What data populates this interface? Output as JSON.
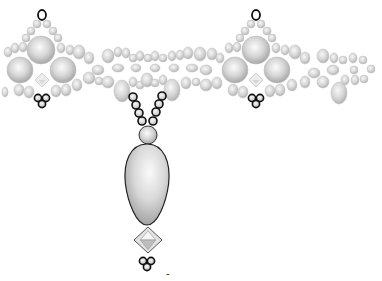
{
  "diagram": {
    "title": "Beaded pendant necklace pattern",
    "type": "beadwork pattern",
    "colors": {
      "background": "#ffffff",
      "bead_light": "#f4f4f4",
      "bead_mid": "#d2d2d2",
      "bead_dark": "#9c9c9c",
      "outline_bold": "#111111",
      "outline_soft": "#8a8a8a"
    },
    "legend": {
      "bold_outline": "highlighted seed beads (thread path)",
      "grey_bead": "seed / round beads",
      "large_round": "large pearl beads",
      "bicone": "bicone crystal",
      "drop": "teardrop pendant"
    },
    "motifs": [
      {
        "name": "left-cluster",
        "cx": 42,
        "cy": 68
      },
      {
        "name": "right-cluster",
        "cx": 256,
        "cy": 68
      }
    ],
    "large_pearls": [
      {
        "cx": 41,
        "cy": 50,
        "r": 14
      },
      {
        "cx": 20,
        "cy": 70,
        "r": 13
      },
      {
        "cx": 63,
        "cy": 70,
        "r": 13
      },
      {
        "cx": 256,
        "cy": 50,
        "r": 14
      },
      {
        "cx": 235,
        "cy": 70,
        "r": 13
      },
      {
        "cx": 277,
        "cy": 70,
        "r": 13
      }
    ],
    "bicones_small": [
      {
        "cx": 42,
        "cy": 80,
        "w": 14,
        "h": 14
      },
      {
        "cx": 256,
        "cy": 80,
        "w": 14,
        "h": 14
      }
    ],
    "top_loops": [
      {
        "cx": 42,
        "cy": 15,
        "rx": 4,
        "ry": 5
      },
      {
        "cx": 256,
        "cy": 15,
        "rx": 4,
        "ry": 5
      }
    ],
    "bottom_trefoils": [
      {
        "cx": 42,
        "cy": 98
      },
      {
        "cx": 256,
        "cy": 98
      }
    ],
    "seed_beads": [
      {
        "cx": 37,
        "cy": 24,
        "rx": 4,
        "ry": 4
      },
      {
        "cx": 47,
        "cy": 24,
        "rx": 4,
        "ry": 4
      },
      {
        "cx": 31,
        "cy": 31,
        "rx": 4,
        "ry": 4
      },
      {
        "cx": 53,
        "cy": 31,
        "rx": 4,
        "ry": 4
      },
      {
        "cx": 26,
        "cy": 38,
        "rx": 4,
        "ry": 4
      },
      {
        "cx": 58,
        "cy": 38,
        "rx": 4,
        "ry": 4
      },
      {
        "cx": 15,
        "cy": 48,
        "rx": 4,
        "ry": 5
      },
      {
        "cx": 23,
        "cy": 47,
        "rx": 4,
        "ry": 5
      },
      {
        "cx": 61,
        "cy": 48,
        "rx": 4,
        "ry": 5
      },
      {
        "cx": 70,
        "cy": 50,
        "rx": 4,
        "ry": 5
      },
      {
        "cx": 79,
        "cy": 52,
        "rx": 6,
        "ry": 7
      },
      {
        "cx": 89,
        "cy": 58,
        "rx": 5,
        "ry": 6
      },
      {
        "cx": 98,
        "cy": 70,
        "rx": 6,
        "ry": 5
      },
      {
        "cx": 19,
        "cy": 90,
        "rx": 5,
        "ry": 6
      },
      {
        "cx": 29,
        "cy": 92,
        "rx": 5,
        "ry": 6
      },
      {
        "cx": 56,
        "cy": 91,
        "rx": 5,
        "ry": 6
      },
      {
        "cx": 66,
        "cy": 90,
        "rx": 5,
        "ry": 6
      },
      {
        "cx": 77,
        "cy": 85,
        "rx": 5,
        "ry": 6
      },
      {
        "cx": 89,
        "cy": 78,
        "rx": 6,
        "ry": 6
      },
      {
        "cx": 99,
        "cy": 81,
        "rx": 4,
        "ry": 4
      },
      {
        "cx": 108,
        "cy": 82,
        "rx": 6,
        "ry": 6
      },
      {
        "cx": 108,
        "cy": 56,
        "rx": 6,
        "ry": 7
      },
      {
        "cx": 118,
        "cy": 52,
        "rx": 4,
        "ry": 5
      },
      {
        "cx": 126,
        "cy": 53,
        "rx": 4,
        "ry": 5
      },
      {
        "cx": 133,
        "cy": 58,
        "rx": 4,
        "ry": 4
      },
      {
        "cx": 140,
        "cy": 56,
        "rx": 4,
        "ry": 5
      },
      {
        "cx": 148,
        "cy": 58,
        "rx": 4,
        "ry": 4
      },
      {
        "cx": 155,
        "cy": 56,
        "rx": 4,
        "ry": 5
      },
      {
        "cx": 163,
        "cy": 58,
        "rx": 4,
        "ry": 4
      },
      {
        "cx": 172,
        "cy": 56,
        "rx": 4,
        "ry": 5
      },
      {
        "cx": 180,
        "cy": 55,
        "rx": 4,
        "ry": 5
      },
      {
        "cx": 188,
        "cy": 53,
        "rx": 5,
        "ry": 6
      },
      {
        "cx": 200,
        "cy": 54,
        "rx": 6,
        "ry": 7
      },
      {
        "cx": 212,
        "cy": 54,
        "rx": 5,
        "ry": 6
      },
      {
        "cx": 220,
        "cy": 58,
        "rx": 4,
        "ry": 5
      },
      {
        "cx": 118,
        "cy": 68,
        "rx": 6,
        "ry": 4
      },
      {
        "cx": 136,
        "cy": 68,
        "rx": 5,
        "ry": 4
      },
      {
        "cx": 155,
        "cy": 68,
        "rx": 5,
        "ry": 4
      },
      {
        "cx": 174,
        "cy": 68,
        "rx": 5,
        "ry": 4
      },
      {
        "cx": 192,
        "cy": 68,
        "rx": 6,
        "ry": 4
      },
      {
        "cx": 206,
        "cy": 70,
        "rx": 6,
        "ry": 5
      },
      {
        "cx": 122,
        "cy": 91,
        "rx": 8,
        "ry": 11
      },
      {
        "cx": 133,
        "cy": 82,
        "rx": 4,
        "ry": 5
      },
      {
        "cx": 140,
        "cy": 85,
        "rx": 4,
        "ry": 4
      },
      {
        "cx": 147,
        "cy": 80,
        "rx": 6,
        "ry": 7
      },
      {
        "cx": 155,
        "cy": 83,
        "rx": 4,
        "ry": 4
      },
      {
        "cx": 163,
        "cy": 80,
        "rx": 4,
        "ry": 5
      },
      {
        "cx": 172,
        "cy": 90,
        "rx": 8,
        "ry": 11
      },
      {
        "cx": 186,
        "cy": 83,
        "rx": 5,
        "ry": 6
      },
      {
        "cx": 196,
        "cy": 82,
        "rx": 4,
        "ry": 4
      },
      {
        "cx": 206,
        "cy": 85,
        "rx": 6,
        "ry": 6
      },
      {
        "cx": 217,
        "cy": 83,
        "rx": 5,
        "ry": 6
      },
      {
        "cx": 251,
        "cy": 24,
        "rx": 4,
        "ry": 4
      },
      {
        "cx": 261,
        "cy": 24,
        "rx": 4,
        "ry": 4
      },
      {
        "cx": 245,
        "cy": 31,
        "rx": 4,
        "ry": 4
      },
      {
        "cx": 267,
        "cy": 31,
        "rx": 4,
        "ry": 4
      },
      {
        "cx": 240,
        "cy": 38,
        "rx": 4,
        "ry": 4
      },
      {
        "cx": 272,
        "cy": 38,
        "rx": 4,
        "ry": 4
      },
      {
        "cx": 229,
        "cy": 48,
        "rx": 4,
        "ry": 5
      },
      {
        "cx": 237,
        "cy": 47,
        "rx": 4,
        "ry": 5
      },
      {
        "cx": 276,
        "cy": 48,
        "rx": 4,
        "ry": 5
      },
      {
        "cx": 285,
        "cy": 50,
        "rx": 4,
        "ry": 5
      },
      {
        "cx": 295,
        "cy": 52,
        "rx": 6,
        "ry": 7
      },
      {
        "cx": 233,
        "cy": 90,
        "rx": 5,
        "ry": 6
      },
      {
        "cx": 243,
        "cy": 92,
        "rx": 5,
        "ry": 6
      },
      {
        "cx": 270,
        "cy": 91,
        "rx": 5,
        "ry": 6
      },
      {
        "cx": 280,
        "cy": 90,
        "rx": 5,
        "ry": 6
      },
      {
        "cx": 292,
        "cy": 85,
        "rx": 5,
        "ry": 6
      },
      {
        "cx": 305,
        "cy": 58,
        "rx": 5,
        "ry": 6
      },
      {
        "cx": 314,
        "cy": 73,
        "rx": 6,
        "ry": 5
      },
      {
        "cx": 305,
        "cy": 82,
        "rx": 5,
        "ry": 6
      },
      {
        "cx": 323,
        "cy": 56,
        "rx": 6,
        "ry": 7
      },
      {
        "cx": 334,
        "cy": 58,
        "rx": 4,
        "ry": 5
      },
      {
        "cx": 343,
        "cy": 60,
        "rx": 4,
        "ry": 4
      },
      {
        "cx": 353,
        "cy": 58,
        "rx": 4,
        "ry": 5
      },
      {
        "cx": 363,
        "cy": 60,
        "rx": 4,
        "ry": 4
      },
      {
        "cx": 333,
        "cy": 70,
        "rx": 6,
        "ry": 5
      },
      {
        "cx": 354,
        "cy": 70,
        "rx": 4,
        "ry": 4
      },
      {
        "cx": 371,
        "cy": 69,
        "rx": 4,
        "ry": 4
      },
      {
        "cx": 323,
        "cy": 82,
        "rx": 6,
        "ry": 6
      },
      {
        "cx": 345,
        "cy": 80,
        "rx": 4,
        "ry": 5
      },
      {
        "cx": 355,
        "cy": 80,
        "rx": 4,
        "ry": 5
      },
      {
        "cx": 364,
        "cy": 79,
        "rx": 4,
        "ry": 4
      },
      {
        "cx": 339,
        "cy": 93,
        "rx": 8,
        "ry": 11
      },
      {
        "cx": 8,
        "cy": 52,
        "rx": 4,
        "ry": 5
      },
      {
        "cx": 5,
        "cy": 92,
        "rx": 3,
        "ry": 5
      }
    ],
    "center_strand": {
      "left_chain": [
        {
          "cx": 133,
          "cy": 97,
          "rx": 4,
          "ry": 4
        },
        {
          "cx": 136,
          "cy": 105,
          "rx": 4,
          "ry": 4
        },
        {
          "cx": 139,
          "cy": 113,
          "rx": 4,
          "ry": 4
        },
        {
          "cx": 142,
          "cy": 121,
          "rx": 4,
          "ry": 4
        }
      ],
      "right_chain": [
        {
          "cx": 162,
          "cy": 96,
          "rx": 4,
          "ry": 4
        },
        {
          "cx": 159,
          "cy": 104,
          "rx": 4,
          "ry": 4
        },
        {
          "cx": 156,
          "cy": 112,
          "rx": 4,
          "ry": 4
        },
        {
          "cx": 153,
          "cy": 121,
          "rx": 4,
          "ry": 4
        }
      ],
      "connector_round": {
        "cx": 148,
        "cy": 135,
        "r": 9
      },
      "teardrop": {
        "cx": 147,
        "top": 144,
        "bottom": 225,
        "max_rx": 24
      },
      "bicone": {
        "cx": 148,
        "cy": 240,
        "w": 28,
        "h": 26
      },
      "trefoil": {
        "cx": 147,
        "cy": 261
      }
    },
    "stray_mark": {
      "x": 166,
      "y": 277,
      "text": "-"
    }
  }
}
